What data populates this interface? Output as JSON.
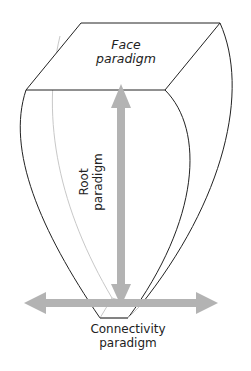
{
  "diagram": {
    "face_label": "Face\nparadigm",
    "face_line1": "Face",
    "face_line2": "paradigm",
    "root_line1": "Root",
    "root_line2": "paradigm",
    "conn_line1": "Connectivity",
    "conn_line2": "paradigm",
    "colors": {
      "outline": "#222222",
      "arrow": "#b3b3b3",
      "inner_line": "#c8c8c8"
    }
  }
}
